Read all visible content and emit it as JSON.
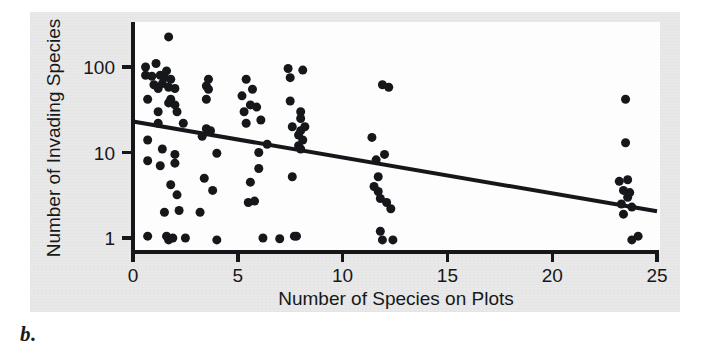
{
  "figure": {
    "panel_letter": "b.",
    "background_color": "#e9e9e9",
    "plot_background_color": "#fdfdfd",
    "ink_color": "#15171a"
  },
  "chart_data": {
    "type": "scatter",
    "title": "",
    "xlabel": "Number of Species on Plots",
    "ylabel": "Number of Invading Species",
    "xlim": [
      0,
      25
    ],
    "ylim": [
      0.7,
      260
    ],
    "yscale": "log",
    "xscale": "linear",
    "grid": false,
    "legend": null,
    "xticks": [
      0,
      5,
      10,
      15,
      20,
      25
    ],
    "xtick_labels": [
      "0",
      "5",
      "10",
      "15",
      "20",
      "25"
    ],
    "yticks": [
      1,
      10,
      100
    ],
    "ytick_labels": [
      "1",
      "10",
      "100"
    ],
    "marker": "filled-circle",
    "marker_color": "#15171a",
    "marker_size_px": 9,
    "trendline": {
      "type": "linear-on-log-y",
      "color": "#15171a",
      "width_px": 4,
      "x_start": 0,
      "y_start": 23,
      "x_end": 25,
      "y_end": 2.05
    },
    "points": [
      [
        0.6,
        100
      ],
      [
        0.6,
        80
      ],
      [
        0.7,
        42
      ],
      [
        0.7,
        14
      ],
      [
        0.7,
        8
      ],
      [
        0.7,
        1.05
      ],
      [
        0.9,
        78
      ],
      [
        1.0,
        62
      ],
      [
        1.1,
        110
      ],
      [
        1.2,
        56
      ],
      [
        1.2,
        30
      ],
      [
        1.2,
        22
      ],
      [
        1.3,
        80
      ],
      [
        1.3,
        7
      ],
      [
        1.4,
        64
      ],
      [
        1.4,
        11
      ],
      [
        1.5,
        75
      ],
      [
        1.5,
        2
      ],
      [
        1.6,
        90
      ],
      [
        1.6,
        1.05
      ],
      [
        1.7,
        225
      ],
      [
        1.7,
        58
      ],
      [
        1.7,
        38
      ],
      [
        1.7,
        0.95
      ],
      [
        1.8,
        72
      ],
      [
        1.8,
        42
      ],
      [
        1.8,
        4.2
      ],
      [
        1.9,
        1.0
      ],
      [
        2.0,
        56
      ],
      [
        2.0,
        36
      ],
      [
        2.0,
        9.5
      ],
      [
        2.0,
        7.5
      ],
      [
        2.1,
        30
      ],
      [
        2.1,
        3.2
      ],
      [
        2.2,
        2.1
      ],
      [
        2.4,
        22
      ],
      [
        2.5,
        1.0
      ],
      [
        3.2,
        2.0
      ],
      [
        3.3,
        15.5
      ],
      [
        3.4,
        5.0
      ],
      [
        3.5,
        60
      ],
      [
        3.5,
        42
      ],
      [
        3.5,
        19
      ],
      [
        3.6,
        72
      ],
      [
        3.6,
        55
      ],
      [
        3.7,
        18
      ],
      [
        3.8,
        3.6
      ],
      [
        4.0,
        9.8
      ],
      [
        4.0,
        0.95
      ],
      [
        5.2,
        46
      ],
      [
        5.3,
        30
      ],
      [
        5.4,
        72
      ],
      [
        5.4,
        22
      ],
      [
        5.5,
        2.6
      ],
      [
        5.6,
        36
      ],
      [
        5.6,
        4.5
      ],
      [
        5.7,
        55
      ],
      [
        5.8,
        2.7
      ],
      [
        5.9,
        34
      ],
      [
        6.0,
        10
      ],
      [
        6.0,
        6.5
      ],
      [
        6.1,
        24
      ],
      [
        6.2,
        1.0
      ],
      [
        6.4,
        12.5
      ],
      [
        7.0,
        0.98
      ],
      [
        7.4,
        96
      ],
      [
        7.5,
        75
      ],
      [
        7.5,
        40
      ],
      [
        7.6,
        20
      ],
      [
        7.6,
        5.2
      ],
      [
        7.7,
        1.05
      ],
      [
        7.8,
        1.05
      ],
      [
        7.9,
        16
      ],
      [
        7.9,
        12
      ],
      [
        8.0,
        30
      ],
      [
        8.0,
        25
      ],
      [
        8.0,
        18
      ],
      [
        8.0,
        11
      ],
      [
        8.1,
        92
      ],
      [
        8.1,
        14
      ],
      [
        8.2,
        20
      ],
      [
        11.4,
        15
      ],
      [
        11.5,
        4.0
      ],
      [
        11.6,
        8.2
      ],
      [
        11.7,
        5.2
      ],
      [
        11.7,
        3.5
      ],
      [
        11.8,
        2.9
      ],
      [
        11.8,
        1.2
      ],
      [
        11.9,
        62
      ],
      [
        11.9,
        0.95
      ],
      [
        12.0,
        9.5
      ],
      [
        12.1,
        2.6
      ],
      [
        12.2,
        58
      ],
      [
        12.3,
        2.2
      ],
      [
        12.4,
        0.95
      ],
      [
        23.2,
        4.6
      ],
      [
        23.3,
        2.5
      ],
      [
        23.4,
        3.6
      ],
      [
        23.4,
        1.9
      ],
      [
        23.5,
        42
      ],
      [
        23.5,
        13
      ],
      [
        23.6,
        4.8
      ],
      [
        23.6,
        3.0
      ],
      [
        23.7,
        3.4
      ],
      [
        23.8,
        2.3
      ],
      [
        23.8,
        0.95
      ],
      [
        24.1,
        1.05
      ]
    ]
  }
}
